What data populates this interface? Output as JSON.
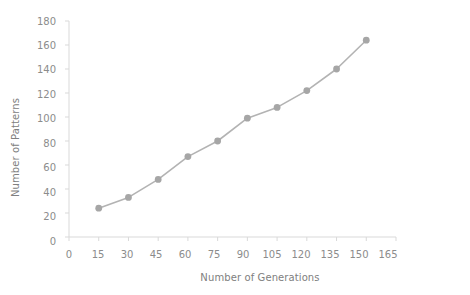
{
  "chart_data": {
    "type": "line",
    "title": "",
    "xlabel": "Number of Generations",
    "ylabel": "Number of Patterns",
    "x": [
      15,
      30,
      45,
      60,
      75,
      90,
      105,
      120,
      135,
      150
    ],
    "values": [
      24,
      33,
      48,
      67,
      80,
      99,
      108,
      122,
      140,
      164
    ],
    "series": [
      {
        "name": "Number of Patterns",
        "values": [
          24,
          33,
          48,
          67,
          80,
          99,
          108,
          122,
          140,
          164
        ]
      }
    ],
    "xlim": [
      0,
      165
    ],
    "ylim": [
      0,
      180
    ],
    "xticks": [
      0,
      15,
      30,
      45,
      60,
      75,
      90,
      105,
      120,
      135,
      150,
      165
    ],
    "yticks": [
      0,
      20,
      40,
      60,
      80,
      100,
      120,
      140,
      160,
      180
    ],
    "xtick_labels": [
      "0",
      "15",
      "30",
      "45",
      "60",
      "75",
      "90",
      "105",
      "120",
      "135",
      "150",
      "165"
    ],
    "ytick_labels": [
      "0",
      "20",
      "40",
      "60",
      "80",
      "100",
      "120",
      "140",
      "160",
      "180"
    ],
    "grid": false,
    "legend": false,
    "legend_position": "none",
    "marker": "circle",
    "colors": {
      "line": "#b3b3b3",
      "marker": "#a6a6a6",
      "axis": "#d9d9d9",
      "tick_text": "#8c8c8c",
      "title_text": "#808080",
      "background": "#ffffff"
    }
  }
}
